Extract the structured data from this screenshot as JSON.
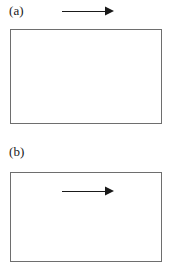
{
  "figure": {
    "background_color": "#ffffff",
    "line_color": "#1a1a1a",
    "frame_color": "#6e6e6e",
    "panels": [
      {
        "id": "a",
        "label": "(a)",
        "frame": {
          "x": 10,
          "y": 29,
          "width": 152,
          "height": 95,
          "fill": "#ffffff",
          "stroke": "#6e6e6e",
          "stroke_width": 1
        },
        "arrow": {
          "name": "flow-direction-arrow",
          "direction": "right",
          "position": "above-frame",
          "x_start": 62,
          "x_end": 113,
          "y": 11,
          "length": 51,
          "color": "#1a1a1a",
          "head_style": "solid-triangle"
        }
      },
      {
        "id": "b",
        "label": "(b)",
        "frame": {
          "x": 10,
          "y": 172,
          "width": 152,
          "height": 90,
          "fill": "#ffffff",
          "stroke": "#6e6e6e",
          "stroke_width": 1
        },
        "arrow": {
          "name": "flow-direction-arrow",
          "direction": "right",
          "position": "inside-frame",
          "x_start": 62,
          "x_end": 113,
          "y": 190,
          "length": 51,
          "color": "#1a1a1a",
          "head_style": "solid-triangle"
        }
      }
    ]
  }
}
